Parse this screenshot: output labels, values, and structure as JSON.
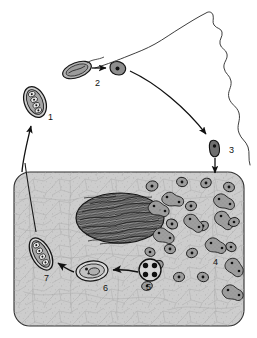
{
  "figure": {
    "caption": "",
    "background_color": "#ffffff",
    "width": 257,
    "height": 338
  },
  "colors": {
    "ink": "#1a1a1a",
    "outline": "#2a2a2a",
    "cell_fill": "#c9c9c9",
    "cell_fill_light": "#d4d4d4",
    "cytoplasm_texture": "#b4b4b4",
    "nucleus_fill": "#8c8c8c",
    "nucleus_hatch": "#1c1c1c",
    "stage_fill": "#9a9a9a",
    "stage_fill_dark": "#6e6e6e",
    "stage_dark": "#4a4a4a",
    "arrow": "#111111",
    "label_text": "#111111"
  },
  "host_outline": {
    "name": "host-organism-outline",
    "description": "irregular wavy contour at upper right"
  },
  "host_cell": {
    "name": "host-cell",
    "description": "large rounded rectangle with stippled cytoplasm",
    "nucleus_label": ""
  },
  "stages": [
    {
      "id": "1",
      "label": "1",
      "name": "stage-1-oocyst",
      "label_x": 48,
      "label_y": 120,
      "shape": "ellipse-segmented",
      "cx": 35,
      "cy": 102,
      "rx": 10,
      "ry": 15,
      "rotate": -22
    },
    {
      "id": "2",
      "label": "2",
      "name": "stage-2-sporozoite",
      "label_x": 95,
      "label_y": 86,
      "shape": "ellipse-elongate",
      "cx": 77,
      "cy": 70,
      "rx": 14,
      "ry": 7,
      "rotate": -20
    },
    {
      "id": "3",
      "label": "3",
      "name": "stage-3-invading-form",
      "label_x": 229,
      "label_y": 153,
      "shape": "blob-dark",
      "cx": 215,
      "cy": 148,
      "rx": 5,
      "ry": 8,
      "rotate": 0
    },
    {
      "id": "4",
      "label": "4",
      "name": "stage-4-dividing-forms",
      "label_x": 213,
      "label_y": 265,
      "shape": "cluster-dividing",
      "cx": 195,
      "cy": 235,
      "rx": 0,
      "ry": 0,
      "rotate": 0
    },
    {
      "id": "5",
      "label": "5",
      "name": "stage-5-quadrinucleate-cyst",
      "label_x": 146,
      "label_y": 290,
      "shape": "circle-four-nuclei",
      "cx": 150,
      "cy": 270,
      "rx": 11,
      "ry": 11,
      "rotate": 0
    },
    {
      "id": "6",
      "label": "6",
      "name": "stage-6-developing-cyst",
      "label_x": 103,
      "label_y": 291,
      "shape": "ellipse-double-wall",
      "cx": 92,
      "cy": 271,
      "rx": 15,
      "ry": 9,
      "rotate": -6
    },
    {
      "id": "7",
      "label": "7",
      "name": "stage-7-mature-oocyst",
      "label_x": 44,
      "label_y": 281,
      "shape": "ellipse-segmented",
      "cx": 41,
      "cy": 254,
      "rx": 9,
      "ry": 17,
      "rotate": -28
    }
  ],
  "arrows": [
    {
      "name": "arrow-stage2-to-sporozoite",
      "from": "stage-2-oocyst",
      "to": "stage-2-free-form"
    },
    {
      "name": "arrow-sporozoite-to-stage3",
      "from": "stage-2",
      "to": "stage-3"
    },
    {
      "name": "arrow-stage3-into-cell",
      "from": "stage-3",
      "to": "host-cell"
    },
    {
      "name": "arrow-stage4-to-stage5",
      "from": "stage-4",
      "to": "stage-5"
    },
    {
      "name": "arrow-stage5-to-stage6",
      "from": "stage-5",
      "to": "stage-6"
    },
    {
      "name": "arrow-stage6-to-stage7",
      "from": "stage-6",
      "to": "stage-7"
    },
    {
      "name": "arrow-cell-to-stage1",
      "from": "host-cell",
      "to": "stage-1"
    },
    {
      "name": "pointer-line-to-stage7",
      "from": "label-line",
      "to": "stage-7"
    }
  ]
}
